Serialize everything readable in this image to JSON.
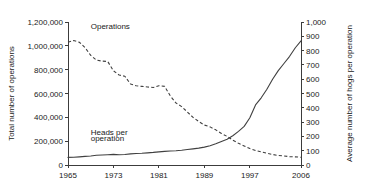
{
  "chart_data": {
    "type": "line",
    "title": "",
    "subtitle": "",
    "xlabel": "",
    "ylabel": "Total number of operations",
    "ylabel_right": "Average number of hogs per operation",
    "grid": false,
    "legend_position": "inline-annotation",
    "xlim": [
      1965,
      2006
    ],
    "ylim": [
      0,
      1200000
    ],
    "ylim_right": [
      0,
      1000
    ],
    "xticks": [
      1965,
      1973,
      1981,
      1989,
      1997,
      2006
    ],
    "xticklabels": [
      "1965",
      "1973",
      "1981",
      "1989",
      "1997",
      "2006"
    ],
    "yticks": [
      0,
      200000,
      400000,
      600000,
      800000,
      1000000,
      1200000
    ],
    "yticklabels": [
      "0",
      "200,000",
      "400,000",
      "600,000",
      "800,000",
      "1,000,000",
      "1,200,000"
    ],
    "yticks_right": [
      0,
      100,
      200,
      300,
      400,
      500,
      600,
      700,
      800,
      900,
      1000
    ],
    "yticklabels_right": [
      "0",
      "100",
      "200",
      "300",
      "400",
      "500",
      "600",
      "700",
      "800",
      "900",
      "1,000"
    ],
    "annotations": [
      {
        "text": "Operations",
        "x": 1969,
        "y": 1140000,
        "axis": "left"
      },
      {
        "text": "Heads per",
        "x": 1969,
        "y": 255000,
        "axis": "left"
      },
      {
        "text": "operation",
        "x": 1969,
        "y": 205000,
        "axis": "left"
      }
    ],
    "series": [
      {
        "name": "Operations",
        "axis": "left",
        "style": "dashed",
        "color": "#404040",
        "x": [
          1965,
          1966,
          1967,
          1968,
          1969,
          1970,
          1971,
          1972,
          1973,
          1974,
          1975,
          1976,
          1977,
          1978,
          1979,
          1980,
          1981,
          1982,
          1983,
          1984,
          1985,
          1986,
          1987,
          1988,
          1989,
          1990,
          1991,
          1992,
          1993,
          1994,
          1995,
          1996,
          1997,
          1998,
          1999,
          2000,
          2001,
          2002,
          2003,
          2004,
          2005,
          2006
        ],
        "values": [
          1030000,
          1045000,
          1030000,
          985000,
          920000,
          880000,
          872000,
          868000,
          790000,
          755000,
          745000,
          680000,
          665000,
          660000,
          655000,
          650000,
          665000,
          660000,
          580000,
          520000,
          490000,
          445000,
          400000,
          365000,
          335000,
          320000,
          295000,
          265000,
          240000,
          208000,
          182000,
          160000,
          138000,
          122000,
          110000,
          98000,
          88000,
          80000,
          76000,
          70000,
          68000,
          65000
        ],
        "units": "operations"
      },
      {
        "name": "Heads per operation",
        "axis": "right",
        "style": "solid",
        "color": "#404040",
        "x": [
          1965,
          1966,
          1967,
          1968,
          1969,
          1970,
          1971,
          1972,
          1973,
          1974,
          1975,
          1976,
          1977,
          1978,
          1979,
          1980,
          1981,
          1982,
          1983,
          1984,
          1985,
          1986,
          1987,
          1988,
          1989,
          1990,
          1991,
          1992,
          1993,
          1994,
          1995,
          1996,
          1997,
          1998,
          1999,
          2000,
          2001,
          2002,
          2003,
          2004,
          2005,
          2006
        ],
        "values": [
          53,
          54,
          57,
          60,
          63,
          68,
          70,
          72,
          74,
          72,
          73,
          78,
          80,
          82,
          85,
          88,
          92,
          95,
          98,
          100,
          103,
          108,
          113,
          118,
          125,
          135,
          148,
          165,
          180,
          205,
          235,
          270,
          330,
          420,
          470,
          530,
          600,
          660,
          710,
          760,
          820,
          868
        ],
        "units": "hogs per operation"
      }
    ]
  },
  "layout": {
    "plot": {
      "left": 68,
      "right": 301,
      "top": 22,
      "bottom": 165
    }
  }
}
